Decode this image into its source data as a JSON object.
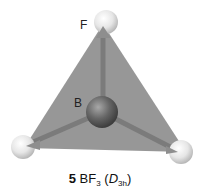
{
  "molecule": {
    "central_atom": "B",
    "outer_atom_label": "F",
    "compound_number": "5",
    "formula_main": "BF",
    "formula_subscript": "3",
    "point_group_letter": "D",
    "point_group_subscript": "3h",
    "paren_open": "(",
    "paren_close": ")"
  },
  "colors": {
    "plane": "#8a8a8a",
    "central_atom": "#5e5e5e",
    "outer_atom": "#e8e8e8",
    "bond": "#7a7a7a"
  }
}
